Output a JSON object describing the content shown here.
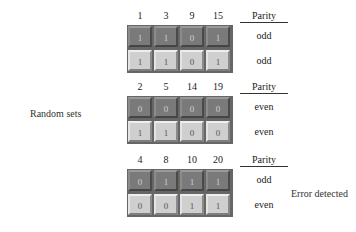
{
  "side_label": "Random sets",
  "parity_header": "Parity",
  "blocks": [
    {
      "columns": [
        "1",
        "3",
        "9",
        "15"
      ],
      "rows": [
        {
          "bits": [
            "1",
            "1",
            "0",
            "1"
          ],
          "parity": "odd",
          "shade": "dark"
        },
        {
          "bits": [
            "1",
            "1",
            "0",
            "1"
          ],
          "parity": "odd",
          "shade": "light"
        }
      ]
    },
    {
      "columns": [
        "2",
        "5",
        "14",
        "19"
      ],
      "rows": [
        {
          "bits": [
            "0",
            "0",
            "0",
            "0"
          ],
          "parity": "even",
          "shade": "dark"
        },
        {
          "bits": [
            "1",
            "1",
            "0",
            "0"
          ],
          "parity": "even",
          "shade": "light"
        }
      ]
    },
    {
      "columns": [
        "4",
        "8",
        "10",
        "20"
      ],
      "rows": [
        {
          "bits": [
            "0",
            "1",
            "1",
            "1"
          ],
          "parity": "odd",
          "shade": "dark"
        },
        {
          "bits": [
            "0",
            "0",
            "1",
            "1"
          ],
          "parity": "even",
          "shade": "light"
        }
      ],
      "annotation": "Error detected"
    }
  ]
}
